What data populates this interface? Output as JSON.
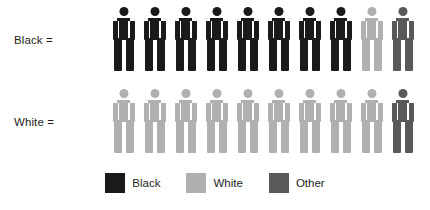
{
  "chart_data": {
    "type": "pictogram",
    "title": "",
    "xlabel": "",
    "ylabel": "",
    "unit_note": "each icon = 1 of 10 persons",
    "icons_per_row": 10,
    "rows": [
      {
        "label": "Black =",
        "icons": [
          "Black",
          "Black",
          "Black",
          "Black",
          "Black",
          "Black",
          "Black",
          "Black",
          "White",
          "Other"
        ],
        "counts": {
          "Black": 8,
          "White": 1,
          "Other": 1
        }
      },
      {
        "label": "White =",
        "icons": [
          "White",
          "White",
          "White",
          "White",
          "White",
          "White",
          "White",
          "White",
          "White",
          "Other"
        ],
        "counts": {
          "Black": 0,
          "White": 9,
          "Other": 1
        }
      }
    ],
    "legend": {
      "position": "bottom-center",
      "entries": [
        {
          "label": "Black",
          "color": "#1a1a1a"
        },
        {
          "label": "White",
          "color": "#b0b0b0"
        },
        {
          "label": "Other",
          "color": "#595959"
        }
      ]
    },
    "colors": {
      "Black": "#1a1a1a",
      "White": "#b0b0b0",
      "Other": "#595959",
      "background": "#ffffff",
      "text": "#231f20"
    }
  }
}
